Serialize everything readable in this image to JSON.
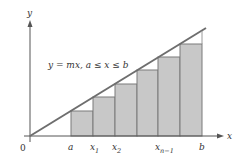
{
  "diagram": {
    "equation": "y = mx, a ≤ x ≤ b",
    "axes": {
      "x_label": "x",
      "y_label": "y",
      "origin_label": "0"
    },
    "tick_labels": [
      {
        "text": "a",
        "sub": "",
        "x": 71
      },
      {
        "text": "x",
        "sub": "1",
        "x": 93
      },
      {
        "text": "x",
        "sub": "2",
        "x": 115
      },
      {
        "text": "x",
        "sub": "n−1",
        "x": 158
      },
      {
        "text": "b",
        "sub": "",
        "x": 202
      }
    ],
    "rectangles": [
      {
        "x0": 71,
        "x1": 93,
        "top": 111
      },
      {
        "x0": 93,
        "x1": 115,
        "top": 97
      },
      {
        "x0": 115,
        "x1": 137,
        "top": 84
      },
      {
        "x0": 137,
        "x1": 158,
        "top": 70
      },
      {
        "x0": 158,
        "x1": 180,
        "top": 57
      },
      {
        "x0": 180,
        "x1": 202,
        "top": 44
      }
    ],
    "colors": {
      "line": "#6e6e6e",
      "rect_fill": "#c8c8c8",
      "rect_stroke": "#7a7a7a",
      "axis": "#555555"
    }
  }
}
